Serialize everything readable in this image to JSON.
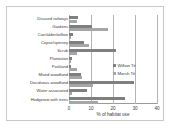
{
  "chart_data": {
    "type": "bar",
    "orientation": "horizontal",
    "title": "",
    "xlabel": "% of habitat use",
    "ylabel": "",
    "xlim": [
      0,
      40
    ],
    "xticks": [
      0,
      10,
      20,
      30,
      40
    ],
    "grid": true,
    "legend_position": "center-right",
    "categories": [
      "Disused railways",
      "Gardens",
      "Carr/alder/willow",
      "Copse/spinney",
      "Scrub",
      "Plantation",
      "Parkland",
      "Mixed woodland",
      "Deciduous woodland",
      "Water associated",
      "Hedgerow with trees"
    ],
    "series": [
      {
        "name": "Willow Tit",
        "color": "#7f7f7f",
        "values": [
          4.0,
          10.5,
          2.0,
          7.0,
          21.5,
          1.5,
          1.0,
          5.5,
          29.5,
          8.0,
          25.5
        ]
      },
      {
        "name": "Marsh Tit",
        "color": "#a6a6a6",
        "values": [
          3.5,
          17.5,
          1.0,
          9.0,
          3.5,
          1.0,
          3.5,
          6.0,
          11.0,
          1.5,
          13.0
        ]
      }
    ]
  },
  "legend": {
    "items": [
      {
        "label": "Willow Tit"
      },
      {
        "label": "Marsh Tit"
      }
    ]
  },
  "axis": {
    "x_title": "% of habitat use",
    "ticks": [
      "0",
      "10",
      "20",
      "30",
      "40"
    ]
  }
}
